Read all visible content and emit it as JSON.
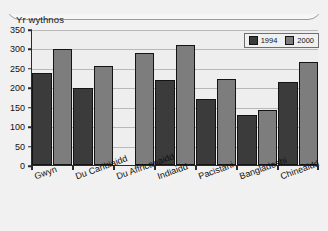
{
  "chart_title": "Yr wythnos",
  "legend": {
    "position": "top-right",
    "entries": [
      {
        "label": "1994",
        "color": "#3b3b3b"
      },
      {
        "label": "2000",
        "color": "#7d7d7d"
      }
    ]
  },
  "y_axis": {
    "ticks": [
      "0",
      "50",
      "100",
      "150",
      "200",
      "250",
      "300",
      "350"
    ],
    "min": 0,
    "max": 350,
    "step": 50
  },
  "chart_data": {
    "type": "bar",
    "title": "Yr wythnos",
    "xlabel": "",
    "ylabel": "",
    "ylim": [
      0,
      350
    ],
    "grid": true,
    "legend_position": "top-right",
    "categories": [
      "Gwyn",
      "Du Caribiaidd",
      "Du Affricanaidd",
      "Indiaidd",
      "Pacistani",
      "Bangladeshi",
      "Chineaidd"
    ],
    "series": [
      {
        "name": "1994",
        "color": "#3b3b3b",
        "values": [
          238,
          199,
          null,
          218,
          169,
          130,
          213
        ]
      },
      {
        "name": "2000",
        "color": "#7d7d7d",
        "values": [
          298,
          254,
          288,
          308,
          222,
          142,
          265
        ]
      }
    ]
  }
}
